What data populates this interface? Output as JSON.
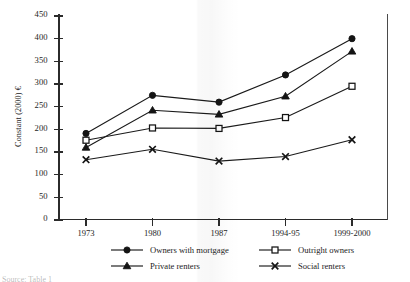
{
  "chart_data": {
    "type": "line",
    "title": "",
    "xlabel": "",
    "ylabel": "Constant (2000) €",
    "categories": [
      "1973",
      "1980",
      "1987",
      "1994-95",
      "1999-2000"
    ],
    "ylim": [
      0,
      450
    ],
    "yticks": [
      0,
      50,
      100,
      150,
      200,
      250,
      300,
      350,
      400,
      450
    ],
    "ytick_labels": [
      "0",
      "50",
      "100",
      "150",
      "200",
      "250",
      "300",
      "350",
      "400",
      "450"
    ],
    "grid": false,
    "legend_position": "below-plot",
    "series": [
      {
        "name": "Owners with mortgage",
        "marker": "filled-circle",
        "values": [
          191,
          275,
          260,
          320,
          400
        ]
      },
      {
        "name": "Outright owners",
        "marker": "open-square",
        "values": [
          176,
          203,
          202,
          226,
          295
        ]
      },
      {
        "name": "Private renters",
        "marker": "filled-triangle",
        "values": [
          160,
          242,
          233,
          273,
          372
        ]
      },
      {
        "name": "Social renters",
        "marker": "cross",
        "values": [
          133,
          156,
          130,
          140,
          177
        ]
      }
    ]
  },
  "axes": {
    "y_title": "Constant (2000) €"
  },
  "legend": {
    "entries": [
      {
        "label": "Owners with mortgage",
        "marker": "filled-circle"
      },
      {
        "label": "Private renters",
        "marker": "filled-triangle"
      },
      {
        "label": "Outright owners",
        "marker": "open-square"
      },
      {
        "label": "Social renters",
        "marker": "cross"
      }
    ]
  },
  "footer": {
    "source_note": "Source: Table 1"
  }
}
